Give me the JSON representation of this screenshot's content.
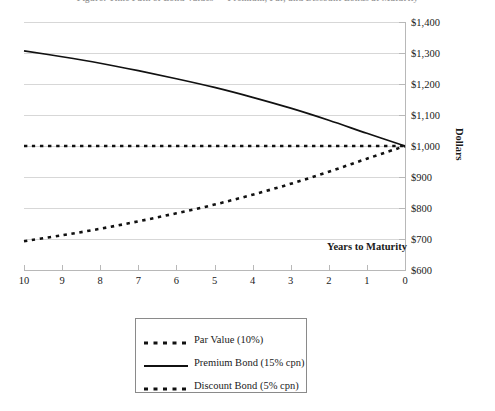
{
  "title_strip": "Figure: Time Path of Bond Values — Premium, Par, and Discount Bonds at Maturity",
  "chart_data": {
    "type": "line",
    "title": "",
    "xlabel": "Years to Maturity",
    "ylabel": "Dollars",
    "xlim": [
      10,
      0
    ],
    "ylim": [
      600,
      1400
    ],
    "x_reversed": true,
    "grid": "horizontal",
    "legend_position": "bottom-center",
    "x_tick_labels": [
      "10",
      "9",
      "8",
      "7",
      "6",
      "5",
      "4",
      "3",
      "2",
      "1",
      "0"
    ],
    "y_tick_labels": [
      "$1,400",
      "$1,300",
      "$1,200",
      "$1,100",
      "$1,000",
      "$900",
      "$800",
      "$700",
      "$600"
    ],
    "x": [
      10,
      9,
      8,
      7,
      6,
      5,
      4,
      3,
      2,
      1,
      0
    ],
    "series": [
      {
        "name": "Par Value (10%)",
        "style": "dashed",
        "color": "#111111",
        "values": [
          1000,
          1000,
          1000,
          1000,
          1000,
          1000,
          1000,
          1000,
          1000,
          1000,
          1000
        ]
      },
      {
        "name": "Premium Bond (15% cpn)",
        "style": "solid",
        "color": "#111111",
        "values": [
          1307,
          1288,
          1267,
          1243,
          1217,
          1189,
          1157,
          1122,
          1083,
          1041,
          1000
        ]
      },
      {
        "name": "Discount Bond (5% cpn)",
        "style": "dashed",
        "color": "#111111",
        "values": [
          693,
          712,
          733,
          757,
          783,
          811,
          843,
          878,
          917,
          959,
          1000
        ]
      }
    ]
  },
  "legend": {
    "items": [
      {
        "label": "Par Value (10%)",
        "style": "dashed"
      },
      {
        "label": "Premium Bond (15% cpn)",
        "style": "solid"
      },
      {
        "label": "Discount Bond (5% cpn)",
        "style": "dashed"
      }
    ]
  }
}
